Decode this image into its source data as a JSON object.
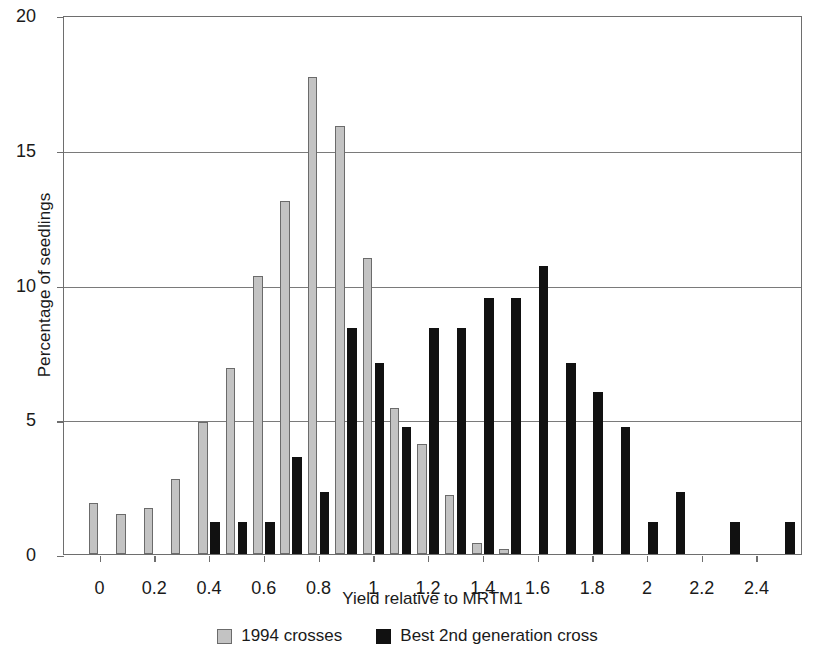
{
  "chart_data": {
    "type": "bar",
    "title": "",
    "xlabel": "Yield relative to MRTM1",
    "ylabel": "Percentage of seedlings",
    "ylim": [
      0,
      20
    ],
    "xlim": [
      -0.1,
      2.6
    ],
    "ytick_labels": [
      "0",
      "5",
      "10",
      "15",
      "20"
    ],
    "ytick_values": [
      0,
      5,
      10,
      15,
      20
    ],
    "xtick_labels": [
      "0",
      "0.2",
      "0.4",
      "0.6",
      "0.8",
      "1",
      "1.2",
      "1.4",
      "1.6",
      "1.8",
      "2",
      "2.2",
      "2.4"
    ],
    "xtick_values": [
      0,
      0.2,
      0.4,
      0.6,
      0.8,
      1,
      1.2,
      1.4,
      1.6,
      1.8,
      2,
      2.2,
      2.4
    ],
    "grid": "horizontal",
    "legend_position": "bottom-center",
    "bin_width": 0.1,
    "x": [
      0,
      0.1,
      0.2,
      0.3,
      0.4,
      0.5,
      0.6,
      0.7,
      0.8,
      0.9,
      1.0,
      1.1,
      1.2,
      1.3,
      1.4,
      1.5,
      1.6,
      1.7,
      1.8,
      1.9,
      2.0,
      2.1,
      2.2,
      2.3,
      2.4,
      2.5
    ],
    "series": [
      {
        "name": "1994 crosses",
        "color": "#c3c3c3",
        "values": [
          1.9,
          1.5,
          1.7,
          2.8,
          4.9,
          6.9,
          10.3,
          13.1,
          17.7,
          15.9,
          11.0,
          5.4,
          4.1,
          2.2,
          0.4,
          0.2,
          0,
          0,
          0,
          0,
          0,
          0,
          0,
          0,
          0,
          0
        ]
      },
      {
        "name": "Best 2nd generation cross",
        "color": "#111111",
        "values": [
          0,
          0,
          0,
          0,
          1.2,
          1.2,
          1.2,
          3.6,
          2.3,
          8.4,
          7.1,
          4.7,
          8.4,
          8.4,
          9.5,
          9.5,
          10.7,
          7.1,
          6.0,
          4.7,
          1.2,
          2.3,
          0,
          1.2,
          0,
          1.2
        ]
      }
    ]
  },
  "legend": {
    "items": [
      {
        "label": "1994 crosses",
        "swatch": "light-gray-square"
      },
      {
        "label": "Best 2nd generation cross",
        "swatch": "black-square"
      }
    ]
  }
}
